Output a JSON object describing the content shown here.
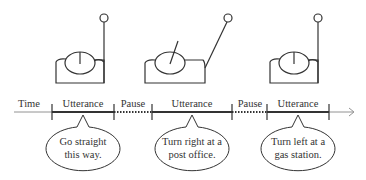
{
  "diagram": {
    "timeline": {
      "axis_label": "Time",
      "segments": [
        {
          "type": "utterance",
          "label": "Utterance",
          "x1": 52,
          "x2": 114
        },
        {
          "type": "pause",
          "label": "Pause",
          "x1": 114,
          "x2": 152
        },
        {
          "type": "utterance",
          "label": "Utterance",
          "x1": 152,
          "x2": 232
        },
        {
          "type": "pause",
          "label": "Pause",
          "x1": 232,
          "x2": 267
        },
        {
          "type": "utterance",
          "label": "Utterance",
          "x1": 267,
          "x2": 329
        }
      ]
    },
    "speech_bubbles": [
      {
        "line1": "Go straight",
        "line2": "this way."
      },
      {
        "line1": "Turn right at a",
        "line2": "post office."
      },
      {
        "line1": "Turn left at a",
        "line2": "gas station."
      }
    ],
    "figures": [
      {
        "name": "robot-1",
        "pointer": "up"
      },
      {
        "name": "robot-2",
        "pointer": "tilted-left"
      },
      {
        "name": "robot-3",
        "pointer": "up"
      }
    ]
  }
}
